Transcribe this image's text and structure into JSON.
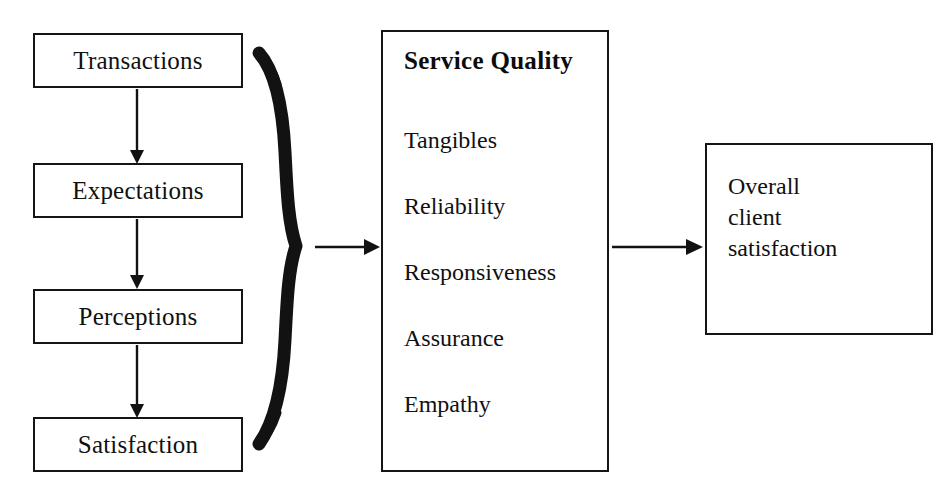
{
  "diagram": {
    "background_color": "#ffffff",
    "line_color": "#151515",
    "text_color": "#101010"
  },
  "flow_column": {
    "name": "client experience sequence",
    "steps": [
      {
        "label": "Transactions"
      },
      {
        "label": "Expectations"
      },
      {
        "label": "Perceptions"
      },
      {
        "label": "Satisfaction"
      }
    ]
  },
  "service_quality": {
    "heading": "Service Quality",
    "dimensions": [
      {
        "label": "Tangibles"
      },
      {
        "label": "Reliability"
      },
      {
        "label": "Responsiveness"
      },
      {
        "label": "Assurance"
      },
      {
        "label": "Empathy"
      }
    ]
  },
  "outcome": {
    "lines": [
      "Overall",
      "client",
      "satisfaction"
    ]
  },
  "connectors": {
    "brace": {
      "name": "right-curly-brace",
      "orientation": "points-right"
    },
    "arrows": [
      {
        "name": "transactions-to-expectations",
        "direction": "down"
      },
      {
        "name": "expectations-to-perceptions",
        "direction": "down"
      },
      {
        "name": "perceptions-to-satisfaction",
        "direction": "down"
      },
      {
        "name": "brace-to-service-quality",
        "direction": "right"
      },
      {
        "name": "service-quality-to-outcome",
        "direction": "right"
      }
    ]
  }
}
